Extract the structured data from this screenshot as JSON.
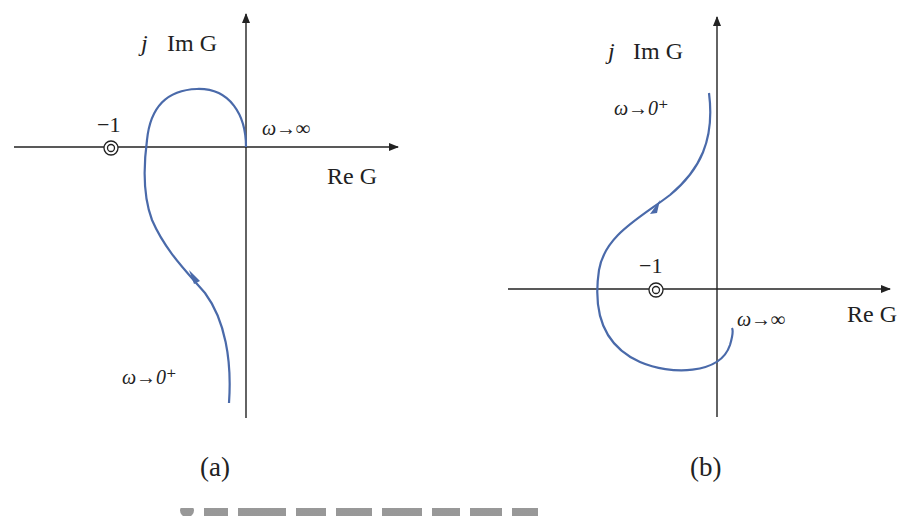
{
  "figure": {
    "panels": [
      {
        "id": "a",
        "caption": "(a)",
        "y_axis_label_j": "j",
        "y_axis_label": "Im G",
        "x_axis_label": "Re G",
        "critical_point_label": "−1",
        "start_label": "ω→0⁺",
        "end_label": "ω→∞"
      },
      {
        "id": "b",
        "caption": "(b)",
        "y_axis_label_j": "j",
        "y_axis_label": "Im G",
        "x_axis_label": "Re G",
        "critical_point_label": "−1",
        "start_label": "ω→0⁺",
        "end_label": "ω→∞"
      }
    ],
    "curve_color": "#4a6aaa",
    "axis_color": "#222222",
    "bottom_caption_visible": "partially cropped figure caption"
  }
}
